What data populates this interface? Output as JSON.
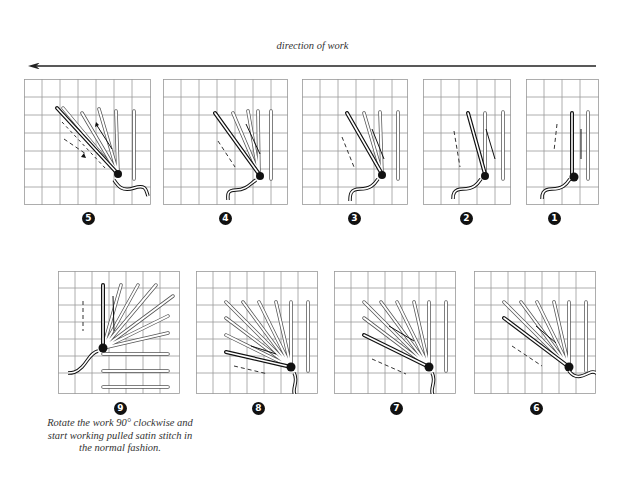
{
  "title": "direction of work",
  "direction_arrow": "left",
  "note": "Rotate the work 90° clockwise and start working pulled satin stitch in the normal fashion.",
  "panels": [
    {
      "step": "1",
      "label": "❶"
    },
    {
      "step": "2",
      "label": "❷"
    },
    {
      "step": "3",
      "label": "❸"
    },
    {
      "step": "4",
      "label": "❹"
    },
    {
      "step": "5",
      "label": "❺"
    },
    {
      "step": "6",
      "label": "❻"
    },
    {
      "step": "7",
      "label": "❼"
    },
    {
      "step": "8",
      "label": "❽"
    },
    {
      "step": "9",
      "label": "❾"
    }
  ],
  "colors": {
    "grid": "#9a9a9a",
    "ink": "#111111",
    "stitch": "#bdbdbd"
  }
}
